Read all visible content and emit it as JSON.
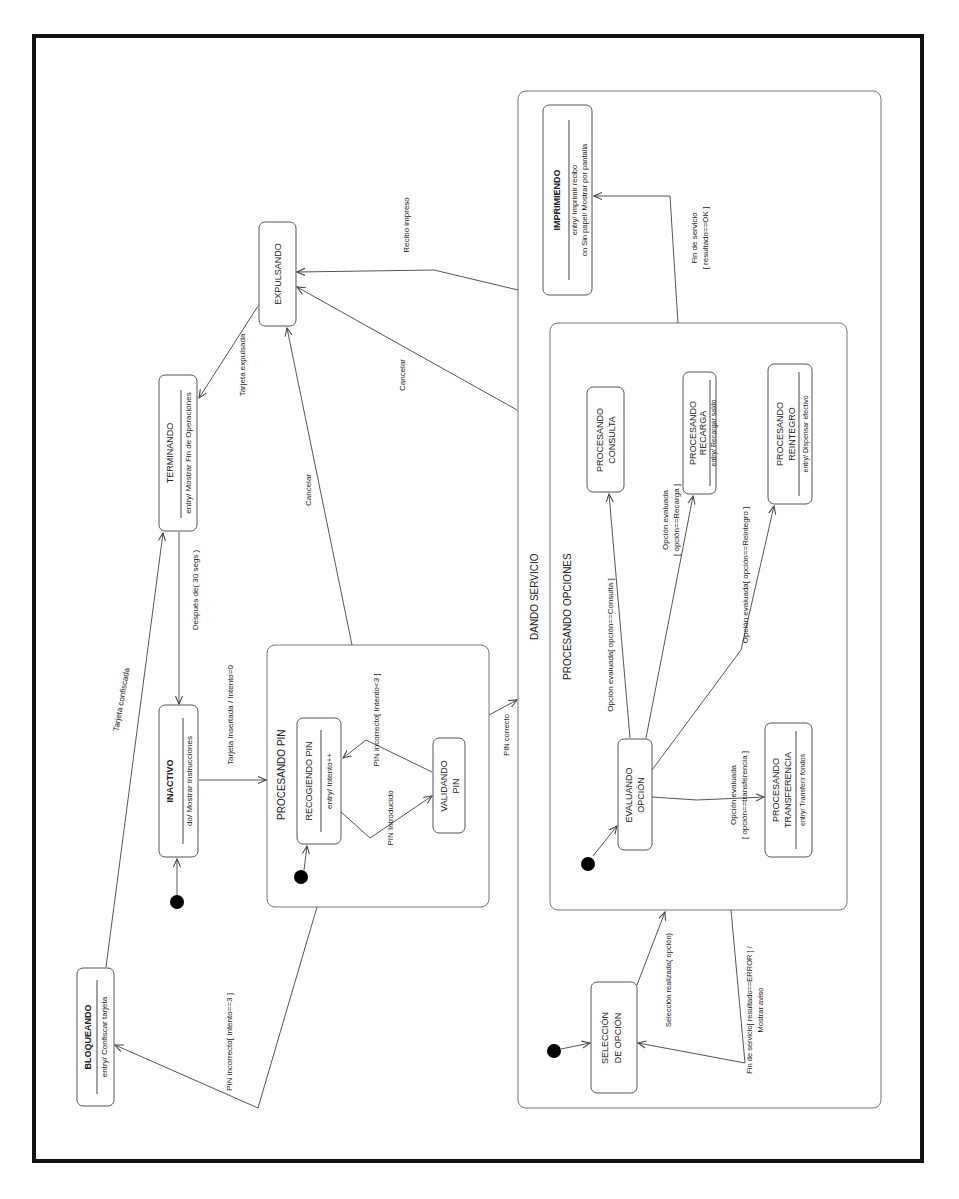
{
  "figure": {
    "frame_color": "#111111",
    "orientation": "rotated 90deg counter-clockwise"
  },
  "states": {
    "bloqueando": {
      "name": "BLOQUEANDO",
      "action": "entry/ Confiscar tarjeta"
    },
    "inactivo": {
      "name": "INACTIVO",
      "action": "do/ Mostrar Instrucciones"
    },
    "terminando": {
      "name": "TERMINANDO",
      "action": "entry/ Mostrar Fin de Operaciones"
    },
    "expulsando": {
      "name": "EXPULSANDO"
    },
    "procesando_pin": {
      "name": "PROCESANDO PIN",
      "recogiendo": {
        "name": "RECOGIENDO PIN",
        "action": "entry/ Intento++"
      },
      "validando": {
        "name_line1": "VALIDANDO",
        "name_line2": "PIN"
      }
    },
    "dando_servicio": {
      "name": "DANDO SERVICIO",
      "imprimiendo": {
        "name": "IMPRIMIENDO",
        "action1": "entry/ Imprimir recibo",
        "action2": "on Sin papel/ Mostrar por pantalla"
      },
      "seleccion": {
        "name_line1": "SELECCIÓN",
        "name_line2": "DE OPCIÓN"
      },
      "procesando_opciones": {
        "name": "PROCESANDO OPCIONES",
        "evaluando": {
          "name_line1": "EVALUANDO",
          "name_line2": "OPCIÓN"
        },
        "consulta": {
          "name_line1": "PROCESANDO",
          "name_line2": "CONSULTA"
        },
        "recarga": {
          "name_line1": "PROCESANDO",
          "name_line2": "RECARGA",
          "action": "entry/ Recargar saldo"
        },
        "reintegro": {
          "name_line1": "PROCESANDO",
          "name_line2": "REINTEGRO",
          "action": "entry/ Dispensar efectivo"
        },
        "transferencia": {
          "name_line1": "PROCESANDO",
          "name_line2": "TRANSFERENCIA",
          "action": "entry/ Transferir fondos"
        }
      }
    }
  },
  "transitions": {
    "tarjeta_confiscada": "Tarjeta confiscada",
    "despues_30": "Después de( 30 segs )",
    "tarjeta_insertada": "Tarjeta Insertada / Intento=0",
    "tarjeta_expulsada": "Tarjeta expulsada",
    "cancelar_pin": "Cancelar",
    "cancelar_servicio": "Cancelar",
    "recibo_impreso": "Recibo impreso",
    "pin_incorrecto_3": "PIN incorrecto[ Intento==3 ]",
    "pin_incorrecto_lt3": "PIN incorrecto[ Intento<3 ]",
    "pin_introducido": "PIN Introducido",
    "pin_correcto": "PIN correcto",
    "fin_ok_1": "Fin de servicio",
    "fin_ok_2": "[ resultado==OK ]",
    "op_consulta": "Opción evaluada[ opción==Consulta ]",
    "op_recarga_1": "Opción evaluada",
    "op_recarga_2": "[ opción==Recarga ]",
    "op_reintegro": "Opción evaluada[ opción==Reintegro ]",
    "op_transf_1": "Opción evaluada",
    "op_transf_2": "[ opción==transferencia ]",
    "seleccion_realizada": "Selección realizada( opción)",
    "fin_error_1": "Fin de servicio[ resultado==ERROR ] /",
    "fin_error_2": "Mostrar aviso"
  }
}
